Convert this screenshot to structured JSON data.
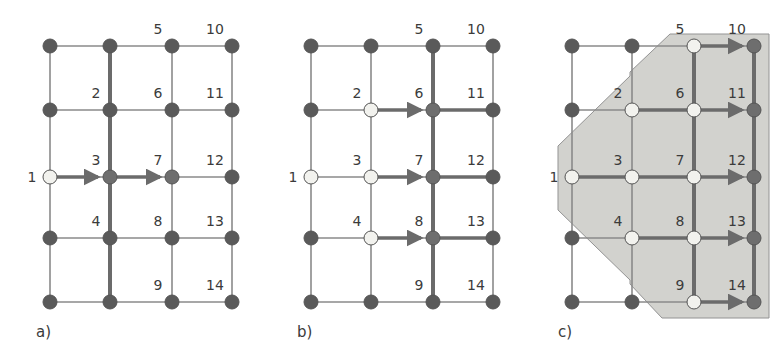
{
  "figure": {
    "width": 783,
    "height": 353,
    "background": "#ffffff"
  },
  "colors": {
    "node_dark": "#5a5a5a",
    "node_mid": "#6e6e6e",
    "node_light": "#f2f2ee",
    "node_stroke": "#555555",
    "edge_normal": "#8a8a8a",
    "edge_highlight": "#6b6b6b",
    "label_text": "#3b3b3b",
    "region_fill": "#d0d0cc",
    "region_stroke": "#8e8e8e",
    "background": "#ffffff"
  },
  "geometry": {
    "columns_x": [
      50,
      110,
      172,
      232
    ],
    "rows_y": [
      46,
      110,
      177,
      238,
      302
    ],
    "node_radius": 7,
    "node_radius_light": 7,
    "panel_offsets_x": [
      0,
      261,
      522
    ]
  },
  "panels": [
    {
      "id": "a",
      "caption": "a)",
      "caption_x": 36,
      "caption_y": 337,
      "visited_nodes": [
        1
      ],
      "frontier_nodes": [
        3,
        7
      ],
      "highlight_edges": [
        {
          "from": [
            0,
            2
          ],
          "to": [
            1,
            2
          ],
          "arrow": true
        },
        {
          "from": [
            1,
            2
          ],
          "to": [
            2,
            2
          ],
          "arrow": true
        }
      ],
      "highlight_columns": [
        1
      ],
      "labels": [
        {
          "text": "1",
          "col": 0,
          "row": 2,
          "dx": -18,
          "dy": 5,
          "anchor": "middle"
        },
        {
          "text": "2",
          "col": 1,
          "row": 1,
          "dx": -14,
          "dy": -12,
          "anchor": "middle"
        },
        {
          "text": "3",
          "col": 1,
          "row": 2,
          "dx": -14,
          "dy": -12,
          "anchor": "middle"
        },
        {
          "text": "4",
          "col": 1,
          "row": 3,
          "dx": -14,
          "dy": -12,
          "anchor": "middle"
        },
        {
          "text": "5",
          "col": 2,
          "row": 0,
          "dx": -14,
          "dy": -12,
          "anchor": "middle"
        },
        {
          "text": "6",
          "col": 2,
          "row": 1,
          "dx": -14,
          "dy": -12,
          "anchor": "middle"
        },
        {
          "text": "7",
          "col": 2,
          "row": 2,
          "dx": -14,
          "dy": -12,
          "anchor": "middle"
        },
        {
          "text": "8",
          "col": 2,
          "row": 3,
          "dx": -14,
          "dy": -12,
          "anchor": "middle"
        },
        {
          "text": "9",
          "col": 2,
          "row": 4,
          "dx": -14,
          "dy": -12,
          "anchor": "middle"
        },
        {
          "text": "10",
          "col": 3,
          "row": 0,
          "dx": -17,
          "dy": -12,
          "anchor": "middle"
        },
        {
          "text": "11",
          "col": 3,
          "row": 1,
          "dx": -17,
          "dy": -12,
          "anchor": "middle"
        },
        {
          "text": "12",
          "col": 3,
          "row": 2,
          "dx": -17,
          "dy": -12,
          "anchor": "middle"
        },
        {
          "text": "13",
          "col": 3,
          "row": 3,
          "dx": -17,
          "dy": -12,
          "anchor": "middle"
        },
        {
          "text": "14",
          "col": 3,
          "row": 4,
          "dx": -17,
          "dy": -12,
          "anchor": "middle"
        }
      ],
      "region": null
    },
    {
      "id": "b",
      "caption": "b)",
      "caption_x": 36,
      "caption_y": 337,
      "visited_nodes": [
        1,
        2,
        3,
        4
      ],
      "frontier_nodes": [
        6,
        7,
        8
      ],
      "highlight_edges": [
        {
          "from": [
            1,
            1
          ],
          "to": [
            2,
            1
          ],
          "arrow": true
        },
        {
          "from": [
            1,
            2
          ],
          "to": [
            2,
            2
          ],
          "arrow": true
        },
        {
          "from": [
            1,
            3
          ],
          "to": [
            2,
            3
          ],
          "arrow": true
        },
        {
          "from": [
            2,
            1
          ],
          "to": [
            3,
            1
          ],
          "arrow": false
        },
        {
          "from": [
            2,
            2
          ],
          "to": [
            3,
            2
          ],
          "arrow": false
        },
        {
          "from": [
            2,
            3
          ],
          "to": [
            3,
            3
          ],
          "arrow": false
        }
      ],
      "highlight_columns": [
        2
      ],
      "labels": [
        {
          "text": "1",
          "col": 0,
          "row": 2,
          "dx": -18,
          "dy": 5,
          "anchor": "middle"
        },
        {
          "text": "2",
          "col": 1,
          "row": 1,
          "dx": -14,
          "dy": -12,
          "anchor": "middle"
        },
        {
          "text": "3",
          "col": 1,
          "row": 2,
          "dx": -14,
          "dy": -12,
          "anchor": "middle"
        },
        {
          "text": "4",
          "col": 1,
          "row": 3,
          "dx": -14,
          "dy": -12,
          "anchor": "middle"
        },
        {
          "text": "5",
          "col": 2,
          "row": 0,
          "dx": -14,
          "dy": -12,
          "anchor": "middle"
        },
        {
          "text": "6",
          "col": 2,
          "row": 1,
          "dx": -14,
          "dy": -12,
          "anchor": "middle"
        },
        {
          "text": "7",
          "col": 2,
          "row": 2,
          "dx": -14,
          "dy": -12,
          "anchor": "middle"
        },
        {
          "text": "8",
          "col": 2,
          "row": 3,
          "dx": -14,
          "dy": -12,
          "anchor": "middle"
        },
        {
          "text": "9",
          "col": 2,
          "row": 4,
          "dx": -14,
          "dy": -12,
          "anchor": "middle"
        },
        {
          "text": "10",
          "col": 3,
          "row": 0,
          "dx": -17,
          "dy": -12,
          "anchor": "middle"
        },
        {
          "text": "11",
          "col": 3,
          "row": 1,
          "dx": -17,
          "dy": -12,
          "anchor": "middle"
        },
        {
          "text": "12",
          "col": 3,
          "row": 2,
          "dx": -17,
          "dy": -12,
          "anchor": "middle"
        },
        {
          "text": "13",
          "col": 3,
          "row": 3,
          "dx": -17,
          "dy": -12,
          "anchor": "middle"
        },
        {
          "text": "14",
          "col": 3,
          "row": 4,
          "dx": -17,
          "dy": -12,
          "anchor": "middle"
        }
      ],
      "region": null
    },
    {
      "id": "c",
      "caption": "c)",
      "caption_x": 36,
      "caption_y": 337,
      "visited_nodes": [
        1,
        2,
        3,
        4,
        5,
        6,
        7,
        8,
        9
      ],
      "frontier_nodes": [
        10,
        11,
        12,
        13,
        14
      ],
      "highlight_edges": [
        {
          "from": [
            2,
            0
          ],
          "to": [
            3,
            0
          ],
          "arrow": true
        },
        {
          "from": [
            2,
            1
          ],
          "to": [
            3,
            1
          ],
          "arrow": true
        },
        {
          "from": [
            2,
            2
          ],
          "to": [
            3,
            2
          ],
          "arrow": true
        },
        {
          "from": [
            2,
            3
          ],
          "to": [
            3,
            3
          ],
          "arrow": true
        },
        {
          "from": [
            2,
            4
          ],
          "to": [
            3,
            4
          ],
          "arrow": true
        },
        {
          "from": [
            1,
            1
          ],
          "to": [
            2,
            1
          ],
          "arrow": false
        },
        {
          "from": [
            1,
            2
          ],
          "to": [
            2,
            2
          ],
          "arrow": false
        },
        {
          "from": [
            1,
            3
          ],
          "to": [
            2,
            3
          ],
          "arrow": false
        },
        {
          "from": [
            0,
            2
          ],
          "to": [
            1,
            2
          ],
          "arrow": false
        }
      ],
      "highlight_columns": [
        2,
        3
      ],
      "labels": [
        {
          "text": "1",
          "col": 0,
          "row": 2,
          "dx": -18,
          "dy": 5,
          "anchor": "middle"
        },
        {
          "text": "2",
          "col": 1,
          "row": 1,
          "dx": -14,
          "dy": -12,
          "anchor": "middle"
        },
        {
          "text": "3",
          "col": 1,
          "row": 2,
          "dx": -14,
          "dy": -12,
          "anchor": "middle"
        },
        {
          "text": "4",
          "col": 1,
          "row": 3,
          "dx": -14,
          "dy": -12,
          "anchor": "middle"
        },
        {
          "text": "5",
          "col": 2,
          "row": 0,
          "dx": -14,
          "dy": -12,
          "anchor": "middle"
        },
        {
          "text": "6",
          "col": 2,
          "row": 1,
          "dx": -14,
          "dy": -12,
          "anchor": "middle"
        },
        {
          "text": "7",
          "col": 2,
          "row": 2,
          "dx": -14,
          "dy": -12,
          "anchor": "middle"
        },
        {
          "text": "8",
          "col": 2,
          "row": 3,
          "dx": -14,
          "dy": -12,
          "anchor": "middle"
        },
        {
          "text": "9",
          "col": 2,
          "row": 4,
          "dx": -14,
          "dy": -12,
          "anchor": "middle"
        },
        {
          "text": "10",
          "col": 3,
          "row": 0,
          "dx": -17,
          "dy": -12,
          "anchor": "middle"
        },
        {
          "text": "11",
          "col": 3,
          "row": 1,
          "dx": -17,
          "dy": -12,
          "anchor": "middle"
        },
        {
          "text": "12",
          "col": 3,
          "row": 2,
          "dx": -17,
          "dy": -12,
          "anchor": "middle"
        },
        {
          "text": "13",
          "col": 3,
          "row": 3,
          "dx": -17,
          "dy": -12,
          "anchor": "middle"
        },
        {
          "text": "14",
          "col": 3,
          "row": 4,
          "dx": -17,
          "dy": -12,
          "anchor": "middle"
        }
      ],
      "region": {
        "points": "148,34 247,34 247,318 140,318 108,284 108,280 36,210 36,146 108,76 108,72",
        "label": "visited-region-polygon"
      }
    }
  ]
}
